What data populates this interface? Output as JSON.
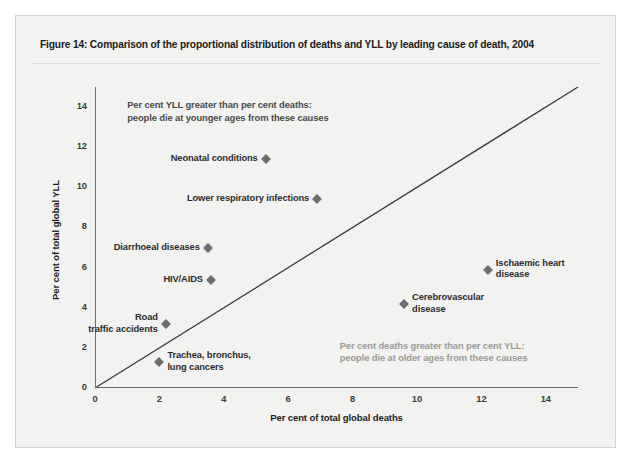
{
  "figure": {
    "title": "Figure 14: Comparison of the proportional distribution of deaths and YLL by leading cause of death, 2004"
  },
  "chart_data": {
    "type": "scatter",
    "title": "Figure 14: Comparison of the proportional distribution of deaths and YLL by leading cause of death, 2004",
    "xlabel": "Per cent of total global deaths",
    "ylabel": "Per cent of total global YLL",
    "xlim": [
      0,
      15
    ],
    "ylim": [
      0,
      15
    ],
    "xticks": [
      0,
      2,
      4,
      6,
      8,
      10,
      12,
      14
    ],
    "yticks": [
      0,
      2,
      4,
      6,
      8,
      10,
      12,
      14
    ],
    "grid": false,
    "legend": "none",
    "reference_line": {
      "description": "y = x identity line",
      "from": [
        0,
        0
      ],
      "to": [
        15,
        15
      ]
    },
    "points": [
      {
        "label": "Neonatal conditions",
        "x": 5.3,
        "y": 11.4,
        "label_side": "left"
      },
      {
        "label": "Lower respiratory infections",
        "x": 6.9,
        "y": 9.4,
        "label_side": "left"
      },
      {
        "label": "Diarrhoeal diseases",
        "x": 3.5,
        "y": 7.0,
        "label_side": "left"
      },
      {
        "label": "HIV/AIDS",
        "x": 3.6,
        "y": 5.4,
        "label_side": "left"
      },
      {
        "label": "Road\ntraffic accidents",
        "x": 2.2,
        "y": 3.2,
        "label_side": "left"
      },
      {
        "label": "Trachea, bronchus,\nlung cancers",
        "x": 2.0,
        "y": 1.3,
        "label_side": "right"
      },
      {
        "label": "Ischaemic heart\ndisease",
        "x": 12.2,
        "y": 5.9,
        "label_side": "right"
      },
      {
        "label": "Cerebrovascular\ndisease",
        "x": 9.6,
        "y": 4.2,
        "label_side": "right"
      }
    ],
    "annotations": [
      {
        "id": "upper-left",
        "text": "Per cent YLL greater than per cent deaths:\npeople die at younger ages from these causes",
        "x": 1.0,
        "y": 14.1
      },
      {
        "id": "lower-right",
        "text": "Per cent deaths greater than per cent YLL:\npeople die at older ages from these causes",
        "x": 7.6,
        "y": 2.1
      }
    ]
  },
  "colors": {
    "frame_background": "#f2f2f0",
    "axis": "#6e6e6e",
    "marker": "#6d6d6d",
    "annotation_upper": "#4a4a4a",
    "annotation_lower": "#9a9a98",
    "title_text": "#1b1b1b"
  }
}
